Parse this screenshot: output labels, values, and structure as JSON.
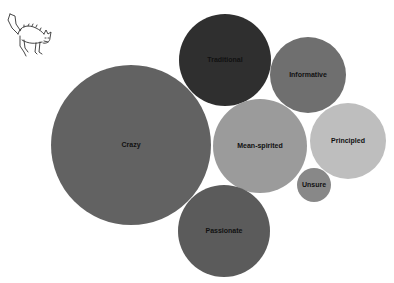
{
  "logo": {
    "icon": "scared-cat-icon"
  },
  "chart_data": {
    "type": "bubble",
    "title": "",
    "layout": "packed-circles",
    "legend": "none",
    "grid": false,
    "series": [
      {
        "label": "Crazy",
        "cx": 131,
        "cy": 145,
        "r": 80,
        "color": "#626262"
      },
      {
        "label": "Traditional",
        "cx": 225,
        "cy": 60,
        "r": 46,
        "color": "#2f2f2f"
      },
      {
        "label": "Informative",
        "cx": 308,
        "cy": 75,
        "r": 38,
        "color": "#6f6f6f"
      },
      {
        "label": "Mean-spirited",
        "cx": 260,
        "cy": 146,
        "r": 47,
        "color": "#9b9b9b"
      },
      {
        "label": "Principled",
        "cx": 348,
        "cy": 141,
        "r": 38,
        "color": "#bebebe"
      },
      {
        "label": "Unsure",
        "cx": 314,
        "cy": 185,
        "r": 17,
        "color": "#888888"
      },
      {
        "label": "Passionate",
        "cx": 224,
        "cy": 231,
        "r": 46,
        "color": "#5b5b5b"
      }
    ],
    "values": {
      "Crazy": 80,
      "Traditional": 46,
      "Informative": 38,
      "Mean-spirited": 47,
      "Principled": 38,
      "Unsure": 17,
      "Passionate": 46
    }
  }
}
